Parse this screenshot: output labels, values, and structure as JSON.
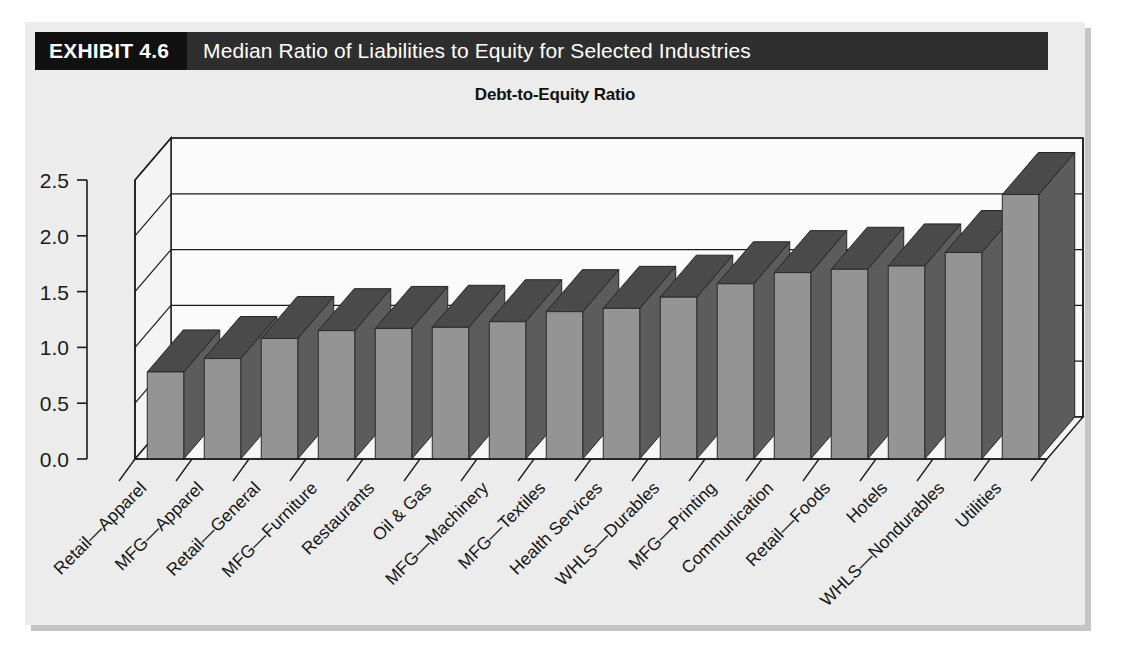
{
  "exhibit": {
    "badge": "EXHIBIT 4.6",
    "title": "Median Ratio of Liabilities to Equity for Selected Industries"
  },
  "chart_data": {
    "type": "bar",
    "title": "Debt-to-Equity Ratio",
    "subtitle": "",
    "xlabel": "",
    "ylabel": "",
    "ylim": [
      0.0,
      2.5
    ],
    "ytick_labels": [
      "0.0",
      "0.5",
      "1.0",
      "1.5",
      "2.0",
      "2.5"
    ],
    "ytick_values": [
      0.0,
      0.5,
      1.0,
      1.5,
      2.0,
      2.5
    ],
    "grid": true,
    "legend": "none",
    "three_d": true,
    "bar_face_color": "#949494",
    "bar_side_color": "#5c5c5c",
    "bar_top_color": "#4a4a4a",
    "categories": [
      "Retail—Apparel",
      "MFG—Apparel",
      "Retail—General",
      "MFG—Furniture",
      "Restaurants",
      "Oil & Gas",
      "MFG—Machinery",
      "MFG—Textiles",
      "Health Services",
      "WHLS—Durables",
      "MFG—Printing",
      "Communication",
      "Retail—Foods",
      "Hotels",
      "WHLS—Nondurables",
      "Utilities"
    ],
    "values": [
      0.78,
      0.9,
      1.08,
      1.15,
      1.17,
      1.18,
      1.23,
      1.32,
      1.35,
      1.45,
      1.57,
      1.67,
      1.7,
      1.73,
      1.85,
      2.37
    ]
  },
  "colors": {
    "header_bar": "#2e2e2e",
    "header_badge": "#111111",
    "panel_background": "#ececec",
    "plot_background": "#fbfbfb",
    "axis": "#1b1b1b"
  }
}
